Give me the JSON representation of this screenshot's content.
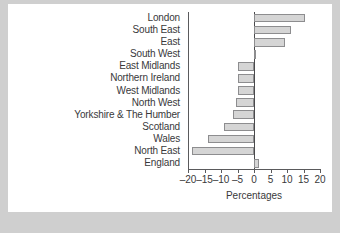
{
  "figure": {
    "background_color": "#ffffff",
    "page_background_color": "#cfcfcf",
    "bar_fill_color": "#d5d5d5",
    "bar_edge_color": "#8d8d8f",
    "axis_color": "#5a5a5c",
    "text_color": "#39393b",
    "caption_faint": ""
  },
  "chart_data": {
    "type": "bar",
    "orientation": "horizontal",
    "title": "",
    "xlabel": "Percentages",
    "ylabel": "",
    "xlim": [
      -20,
      20
    ],
    "xticks": [
      -20,
      -15,
      -10,
      -5,
      0,
      5,
      10,
      15,
      20
    ],
    "xtick_labels": [
      "–20",
      "–15",
      "–10",
      "–5",
      "0",
      "5",
      "10",
      "15",
      "20"
    ],
    "grid": false,
    "legend": null,
    "categories": [
      "London",
      "South East",
      "East",
      "South West",
      "East Midlands",
      "Northern Ireland",
      "West Midlands",
      "North West",
      "Yorkshire & The Humber",
      "Scotland",
      "Wales",
      "North East",
      "England"
    ],
    "values": [
      15.5,
      11.1,
      9.5,
      0.2,
      -4.8,
      -4.8,
      -4.9,
      -5.4,
      -6.3,
      -9.0,
      -14.0,
      -18.7,
      1.6
    ]
  }
}
